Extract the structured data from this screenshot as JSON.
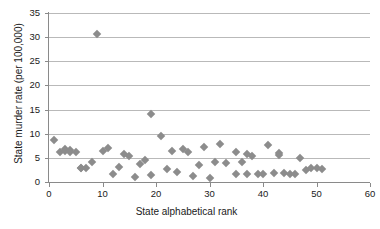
{
  "chart_data": {
    "type": "scatter",
    "title": "",
    "xlabel": "State alphabetical rank",
    "ylabel": "State murder rate (per 100,000)",
    "xlim": [
      0,
      60
    ],
    "ylim": [
      0,
      35
    ],
    "xticks": [
      0,
      10,
      20,
      30,
      40,
      50,
      60
    ],
    "yticks": [
      0,
      5,
      10,
      15,
      20,
      25,
      30,
      35
    ],
    "grid": "horizontal",
    "legend": "none",
    "marker": "diamond",
    "marker_color": "#8c8c8c",
    "series": [
      {
        "name": "State murder rate",
        "points": [
          {
            "x": 1,
            "y": 8.8
          },
          {
            "x": 2,
            "y": 6.3
          },
          {
            "x": 3,
            "y": 6.9
          },
          {
            "x": 3,
            "y": 6.5
          },
          {
            "x": 4,
            "y": 6.7
          },
          {
            "x": 4,
            "y": 6.3
          },
          {
            "x": 5,
            "y": 6.2
          },
          {
            "x": 6,
            "y": 3.0
          },
          {
            "x": 6,
            "y": 2.9
          },
          {
            "x": 7,
            "y": 2.8
          },
          {
            "x": 8,
            "y": 4.2
          },
          {
            "x": 9,
            "y": 30.6
          },
          {
            "x": 10,
            "y": 6.5
          },
          {
            "x": 11,
            "y": 7.0
          },
          {
            "x": 12,
            "y": 1.6
          },
          {
            "x": 13,
            "y": 3.2
          },
          {
            "x": 14,
            "y": 5.7
          },
          {
            "x": 15,
            "y": 5.4
          },
          {
            "x": 16,
            "y": 1.0
          },
          {
            "x": 17,
            "y": 3.8
          },
          {
            "x": 18,
            "y": 4.5
          },
          {
            "x": 19,
            "y": 14.0
          },
          {
            "x": 19,
            "y": 1.4
          },
          {
            "x": 21,
            "y": 9.6
          },
          {
            "x": 22,
            "y": 2.6
          },
          {
            "x": 23,
            "y": 6.4
          },
          {
            "x": 24,
            "y": 2.0
          },
          {
            "x": 25,
            "y": 6.8
          },
          {
            "x": 26,
            "y": 6.3
          },
          {
            "x": 27,
            "y": 1.2
          },
          {
            "x": 28,
            "y": 3.5
          },
          {
            "x": 29,
            "y": 7.2
          },
          {
            "x": 30,
            "y": 0.9
          },
          {
            "x": 31,
            "y": 4.1
          },
          {
            "x": 32,
            "y": 7.9
          },
          {
            "x": 33,
            "y": 3.9
          },
          {
            "x": 35,
            "y": 6.2
          },
          {
            "x": 35,
            "y": 1.7
          },
          {
            "x": 36,
            "y": 4.2
          },
          {
            "x": 37,
            "y": 5.8
          },
          {
            "x": 37,
            "y": 1.7
          },
          {
            "x": 38,
            "y": 5.4
          },
          {
            "x": 39,
            "y": 1.6
          },
          {
            "x": 40,
            "y": 1.7
          },
          {
            "x": 41,
            "y": 7.6
          },
          {
            "x": 42,
            "y": 1.8
          },
          {
            "x": 43,
            "y": 6.0
          },
          {
            "x": 43,
            "y": 5.6
          },
          {
            "x": 44,
            "y": 1.8
          },
          {
            "x": 45,
            "y": 1.7
          },
          {
            "x": 46,
            "y": 1.6
          },
          {
            "x": 47,
            "y": 4.9
          },
          {
            "x": 48,
            "y": 2.5
          },
          {
            "x": 49,
            "y": 2.9
          },
          {
            "x": 50,
            "y": 2.9
          },
          {
            "x": 51,
            "y": 2.7
          }
        ]
      }
    ]
  }
}
